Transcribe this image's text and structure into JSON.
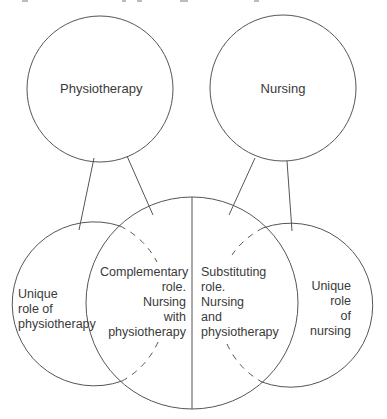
{
  "diagram": {
    "type": "venn-role-overlap",
    "colors": {
      "line": "#555555",
      "text": "#3a3a3a",
      "background": "#ffffff"
    },
    "top_circles": [
      {
        "id": "physiotherapy",
        "label": "Physiotherapy"
      },
      {
        "id": "nursing",
        "label": "Nursing"
      }
    ],
    "bottom_regions": {
      "unique_physio": {
        "lines": [
          "Unique",
          "role of",
          "physiotherapy"
        ]
      },
      "complementary": {
        "lines": [
          "Complementary",
          "role.",
          "Nursing",
          "with",
          "physiotherapy"
        ]
      },
      "substituting": {
        "lines": [
          "Substituting",
          "role.",
          "Nursing",
          "and",
          "physiotherapy"
        ]
      },
      "unique_nursing": {
        "lines": [
          "Unique",
          "role",
          "of",
          "nursing"
        ]
      }
    },
    "connections": [
      {
        "from": "physiotherapy",
        "to": "unique_physio"
      },
      {
        "from": "physiotherapy",
        "to": "complementary"
      },
      {
        "from": "nursing",
        "to": "substituting"
      },
      {
        "from": "nursing",
        "to": "unique_nursing"
      }
    ]
  }
}
